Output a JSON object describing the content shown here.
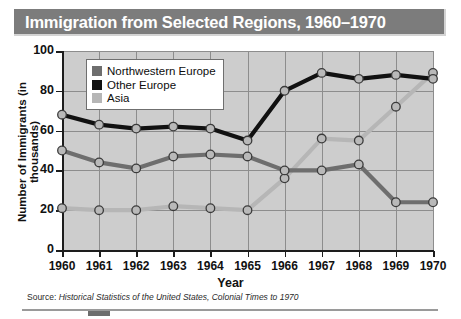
{
  "title": "Immigration from Selected Regions, 1960–1970",
  "source": {
    "prefix": "Source: ",
    "italic": "Historical Statistics of the United States, Colonial Times to 1970"
  },
  "axes": {
    "xlabel": "Year",
    "ylabel": "Number of Immigrants (in thousands)"
  },
  "legend": {
    "items": [
      {
        "label": "Northwestern Europe",
        "color": "#6e6e6e"
      },
      {
        "label": "Other Europe",
        "color": "#111111"
      },
      {
        "label": "Asia",
        "color": "#b6b6b6"
      }
    ]
  },
  "colors": {
    "title_bar": "#7c7c7c",
    "plot_background": "#cdcdcd",
    "grid": "#8d8d8d",
    "axis": "#1d1d1d",
    "marker_fill": "#b9b9b9",
    "marker_stroke": "#3b3b3b"
  },
  "chart_data": {
    "type": "line",
    "title": "Immigration from Selected Regions, 1960–1970",
    "xlabel": "Year",
    "ylabel": "Number of Immigrants (in thousands)",
    "categories": [
      "1960",
      "1961",
      "1962",
      "1963",
      "1964",
      "1965",
      "1966",
      "1967",
      "1968",
      "1969",
      "1970"
    ],
    "x": [
      1960,
      1961,
      1962,
      1963,
      1964,
      1965,
      1966,
      1967,
      1968,
      1969,
      1970
    ],
    "xlim": [
      1960,
      1970
    ],
    "ylim": [
      0,
      100
    ],
    "yticks": [
      0,
      20,
      40,
      60,
      80,
      100
    ],
    "xticks": [
      1960,
      1961,
      1962,
      1963,
      1964,
      1965,
      1966,
      1967,
      1968,
      1969,
      1970
    ],
    "grid": true,
    "legend_position": "upper-left-inside",
    "markers": "circle",
    "series": [
      {
        "name": "Northwestern Europe",
        "color": "#6e6e6e",
        "values": [
          50,
          44,
          41,
          47,
          48,
          47,
          40,
          40,
          43,
          24,
          24
        ]
      },
      {
        "name": "Other Europe",
        "color": "#111111",
        "values": [
          68,
          63,
          61,
          62,
          61,
          55,
          80,
          89,
          86,
          88,
          86
        ]
      },
      {
        "name": "Asia",
        "color": "#b6b6b6",
        "values": [
          21,
          20,
          20,
          22,
          21,
          20,
          36,
          56,
          55,
          72,
          89
        ]
      }
    ]
  }
}
